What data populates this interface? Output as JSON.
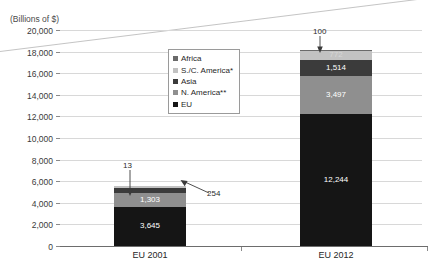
{
  "title_cropped": "",
  "axis_unit_label": "(Billions of $)",
  "chart_data": {
    "type": "bar",
    "subtype": "stacked-bar",
    "title": "",
    "xlabel": "",
    "ylabel": "(Billions of $)",
    "ylim": [
      0,
      20000
    ],
    "ytick_step": 2000,
    "grid": true,
    "legend_position": "inside-top-center",
    "categories": [
      "EU 2001",
      "EU 2012"
    ],
    "ytick_labels": [
      "0",
      "2,000",
      "4,000",
      "6,000",
      "8,000",
      "10,000",
      "12,000",
      "14,000",
      "16,000",
      "18,000",
      "20,000"
    ],
    "stack_order_bottom_to_top": [
      "EU",
      "N. America**",
      "Asia",
      "S./C. America*",
      "Africa"
    ],
    "series": [
      {
        "name": "EU",
        "color": "#151515",
        "values": [
          3645,
          12244
        ],
        "labels": [
          "3,645",
          "12,244"
        ]
      },
      {
        "name": "N. America**",
        "color": "#8f8f8f",
        "values": [
          1303,
          3497
        ],
        "labels": [
          "1,303",
          "3,497"
        ]
      },
      {
        "name": "Asia",
        "color": "#3b3b3b",
        "values": [
          382,
          1514
        ],
        "labels": [
          "382",
          "1,514"
        ]
      },
      {
        "name": "S./C. America*",
        "color": "#c2c2c2",
        "values": [
          254,
          772
        ],
        "labels": [
          "254",
          "772"
        ]
      },
      {
        "name": "Africa",
        "color": "#6a6a6a",
        "values": [
          13,
          100
        ],
        "labels": [
          "13",
          "100"
        ]
      }
    ],
    "totals": [
      5597,
      18127
    ],
    "annotations": [
      {
        "text": "13",
        "series": "Africa",
        "category": "EU 2001",
        "style": "arrow-down"
      },
      {
        "text": "254",
        "series": "S./C. America*",
        "category": "EU 2001",
        "style": "arrow-left"
      },
      {
        "text": "100",
        "series": "Africa",
        "category": "EU 2012",
        "style": "arrow-down"
      }
    ]
  },
  "legend": {
    "items": [
      {
        "label": "Africa",
        "color": "#6a6a6a"
      },
      {
        "label": "S./C. America*",
        "color": "#c2c2c2"
      },
      {
        "label": "Asia",
        "color": "#3b3b3b"
      },
      {
        "label": "N. America**",
        "color": "#8f8f8f"
      },
      {
        "label": "EU",
        "color": "#151515"
      }
    ]
  }
}
